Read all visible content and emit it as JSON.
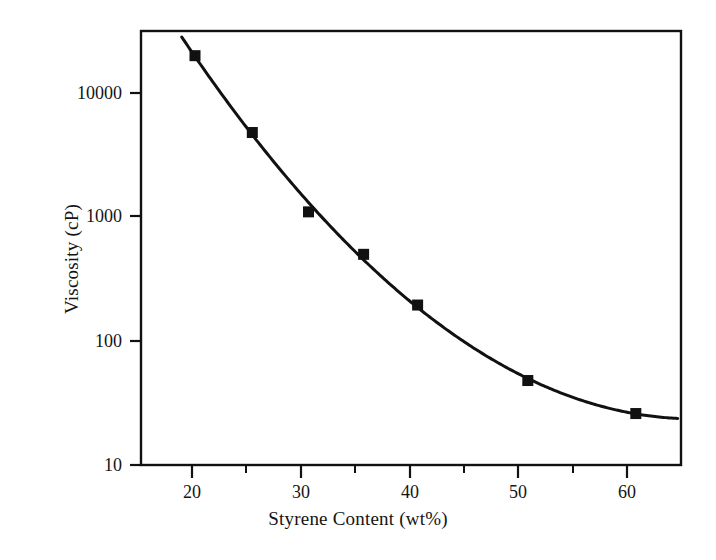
{
  "chart_data": {
    "type": "line",
    "title": "",
    "xlabel": "Styrene Content (wt%)",
    "ylabel": "Viscosity (cP)",
    "xscale": "linear",
    "yscale": "log",
    "xlim": [
      15.3,
      64.3
    ],
    "ylim": [
      10,
      20000
    ],
    "grid": false,
    "legend": null,
    "xticks": [
      20,
      30,
      40,
      50,
      60
    ],
    "xtick_labels": [
      "20",
      "30",
      "40",
      "50",
      "60"
    ],
    "xminor_ticks": [
      25,
      35,
      45,
      55
    ],
    "yticks": [
      10,
      100,
      1000,
      10000
    ],
    "ytick_labels": [
      "10",
      "100",
      "1000",
      "10000"
    ],
    "series": [
      {
        "name": "Viscosity vs styrene content",
        "marker": "filled-square",
        "marker_color": "#111111",
        "line_color": "#111111",
        "x": [
          20.2,
          25.4,
          30.5,
          35.5,
          40.4,
          50.4,
          60.2
        ],
        "y": [
          20000,
          4800,
          1100,
          500,
          195,
          48,
          26
        ]
      }
    ],
    "fit_curve": {
      "description": "smooth monotonic decaying trend line through the data points",
      "x_start": 19.0,
      "x_end": 64.0
    }
  },
  "labels": {
    "x_axis_title": "Styrene Content (wt%)",
    "y_axis_title": "Viscosity (cP)",
    "y_10000": "10000",
    "y_1000": "1000",
    "y_100": "100",
    "y_10": "10",
    "x_20": "20",
    "x_30": "30",
    "x_40": "40",
    "x_50": "50",
    "x_60": "60"
  },
  "colors": {
    "background": "#ffffff",
    "ink": "#111111",
    "text": "#141414"
  }
}
